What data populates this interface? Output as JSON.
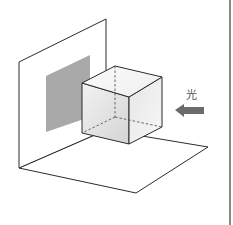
{
  "diagram": {
    "light_label": "光",
    "colors": {
      "line": "#2b2b2b",
      "shadow": "#a9a9a9",
      "arrow": "#6b6b6b",
      "cube_face_light": "#f4f4f4",
      "cube_face_dark": "#d6d6d6",
      "divider": "#8a8a8a"
    }
  }
}
